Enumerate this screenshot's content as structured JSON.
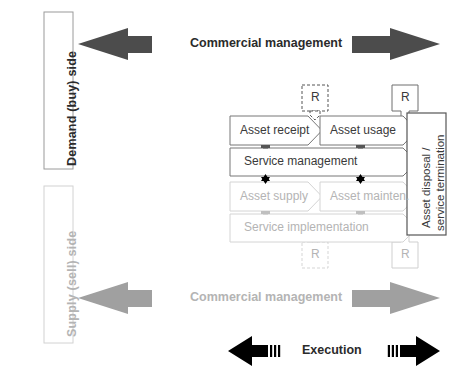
{
  "diagram": {
    "colors": {
      "dark": "#4a4a4a",
      "darkest": "#000000",
      "gray": "#a8a8a8",
      "light_gray": "#c8c8c8",
      "very_light_gray": "#e2e2e2",
      "text_dark": "#2b2b2b",
      "text_gray": "#b4b4b4",
      "outline": "#6e6e6e"
    },
    "side_labels": {
      "demand": "Demand (buy) side",
      "supply": "Supply (sell) side"
    },
    "band_labels": {
      "commercial_top": "Commercial management",
      "commercial_bottom": "Commercial management",
      "execution": "Execution"
    },
    "process_rows": {
      "top": [
        {
          "label": "Asset receipt",
          "tone": "dark"
        },
        {
          "label": "Asset usage",
          "tone": "dark"
        }
      ],
      "top_wide": {
        "label": "Service management",
        "tone": "dark"
      },
      "bottom": [
        {
          "label": "Asset supply",
          "tone": "gray"
        },
        {
          "label": "Asset mainten.",
          "tone": "gray"
        }
      ],
      "bottom_wide": {
        "label": "Service implementation",
        "tone": "gray"
      }
    },
    "terminator": {
      "line1": "Asset disposal /",
      "line2": "service termination"
    },
    "review_markers": [
      {
        "label": "R",
        "position": "top-left-dashed",
        "tone": "dark",
        "style": "dashed"
      },
      {
        "label": "R",
        "position": "top-right-solid",
        "tone": "dark",
        "style": "solid"
      },
      {
        "label": "R",
        "position": "bottom-left-dashed",
        "tone": "gray",
        "style": "dashed"
      },
      {
        "label": "R",
        "position": "bottom-right-solid",
        "tone": "gray",
        "style": "solid"
      }
    ],
    "arrows": {
      "top_left": {
        "direction": "left",
        "tone": "dark"
      },
      "top_right": {
        "direction": "right",
        "tone": "dark"
      },
      "bottom_left": {
        "direction": "left",
        "tone": "gray"
      },
      "bottom_right": {
        "direction": "right",
        "tone": "gray"
      },
      "execution_left": {
        "direction": "left",
        "tone": "black"
      },
      "execution_right": {
        "direction": "right",
        "tone": "black"
      }
    }
  }
}
